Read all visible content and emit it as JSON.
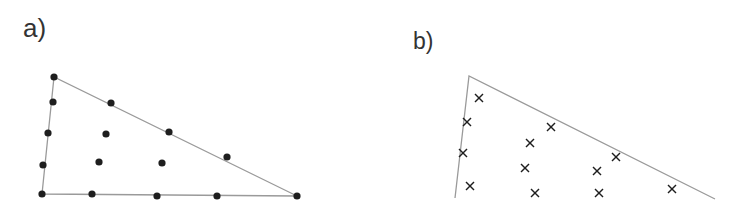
{
  "panels": {
    "a": {
      "label": "a)",
      "marker": "dot",
      "outline": {
        "closed": true,
        "vertices": [
          [
            54,
            77
          ],
          [
            42,
            194
          ],
          [
            297,
            196
          ]
        ]
      },
      "points": [
        [
          54,
          77
        ],
        [
          53,
          102
        ],
        [
          48,
          133
        ],
        [
          43,
          165
        ],
        [
          42,
          194
        ],
        [
          111,
          103
        ],
        [
          169,
          132
        ],
        [
          227,
          157
        ],
        [
          297,
          196
        ],
        [
          92,
          194
        ],
        [
          157,
          196
        ],
        [
          217,
          196
        ],
        [
          106,
          134
        ],
        [
          99,
          162
        ],
        [
          162,
          163
        ]
      ]
    },
    "b": {
      "label": "b)",
      "marker": "cross",
      "outline": {
        "closed": false,
        "vertices": [
          [
            455,
            198
          ],
          [
            469,
            76
          ],
          [
            715,
            199
          ]
        ]
      },
      "points": [
        [
          479,
          98
        ],
        [
          467,
          122
        ],
        [
          463,
          153
        ],
        [
          470,
          186
        ],
        [
          551,
          127
        ],
        [
          530,
          143
        ],
        [
          525,
          168
        ],
        [
          535,
          193
        ],
        [
          616,
          157
        ],
        [
          597,
          171
        ],
        [
          599,
          193
        ],
        [
          672,
          189
        ]
      ]
    }
  },
  "colors": {
    "line": "#9a9a9a",
    "marker": "#1e1e1e",
    "label": "#333333"
  }
}
